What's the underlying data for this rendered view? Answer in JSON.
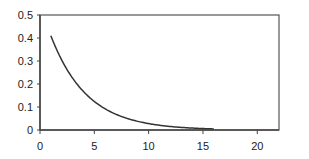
{
  "chart_data": {
    "type": "line",
    "title": "",
    "xlabel": "",
    "ylabel": "",
    "xlim": [
      0,
      22
    ],
    "ylim": [
      0,
      0.5
    ],
    "x_ticks": [
      0,
      5,
      10,
      15,
      20
    ],
    "x_tick_labels": [
      "0",
      "5",
      "10",
      "15",
      "20"
    ],
    "y_ticks": [
      0,
      0.1,
      0.2,
      0.3,
      0.4,
      0.5
    ],
    "y_tick_labels": [
      "0",
      "0.1",
      "0.2",
      "0.3",
      "0.4",
      "0.5"
    ],
    "grid": false,
    "legend": null,
    "series": [
      {
        "name": "series-1",
        "color": "#333333",
        "x": [
          1,
          2,
          3,
          4,
          5,
          6,
          7,
          8,
          9,
          10,
          11,
          12,
          13,
          14,
          15,
          16
        ],
        "y": [
          0.41,
          0.304,
          0.225,
          0.167,
          0.124,
          0.091,
          0.068,
          0.05,
          0.037,
          0.028,
          0.02,
          0.015,
          0.011,
          0.008,
          0.006,
          0.005
        ]
      }
    ]
  }
}
